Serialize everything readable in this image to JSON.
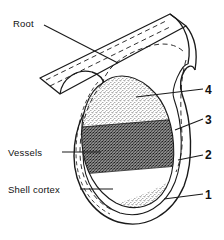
{
  "figure": {
    "type": "botanical-cross-section-diagram",
    "background_color": "#ffffff",
    "line_color": "#1a1a1a"
  },
  "labels": {
    "root": "Root",
    "vessels": "Vessels",
    "shell_cortex": "Shell cortex"
  },
  "callouts": [
    {
      "id": "callout-4",
      "number": "4"
    },
    {
      "id": "callout-3",
      "number": "3"
    },
    {
      "id": "callout-2",
      "number": "2"
    },
    {
      "id": "callout-1",
      "number": "1"
    }
  ],
  "zones": [
    {
      "name": "upper-light-stipple",
      "shade": "light"
    },
    {
      "name": "middle-dark-dense",
      "shade": "dark"
    },
    {
      "name": "lower-white-band",
      "shade": "white"
    },
    {
      "name": "bottom-light-stipple",
      "shade": "light"
    }
  ],
  "icons": {
    "leader_line": "leader-line-icon",
    "dashed_vessel": "dashed-vessel-line-icon"
  }
}
